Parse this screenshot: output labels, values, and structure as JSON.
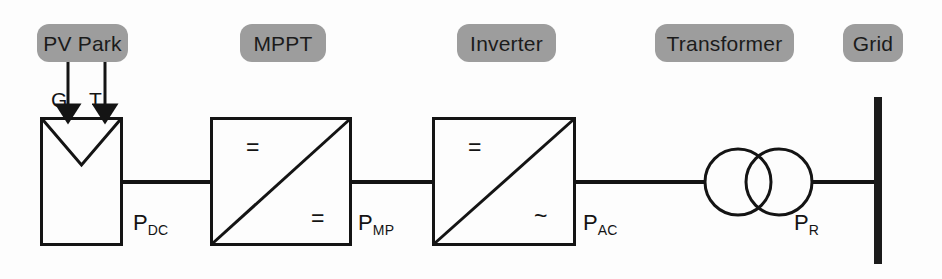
{
  "diagram": {
    "background_color": "#fdfdfd",
    "stroke_color": "#141414",
    "pill_fill": "#9d9d9d",
    "pill_text_color": "#1b1b1b"
  },
  "stage_labels": [
    {
      "id": "pv-park",
      "label": "PV Park"
    },
    {
      "id": "mppt",
      "label": "MPPT"
    },
    {
      "id": "inverter",
      "label": "Inverter"
    },
    {
      "id": "transformer",
      "label": "Transformer"
    },
    {
      "id": "grid",
      "label": "Grid"
    }
  ],
  "inputs": [
    {
      "id": "irradiance",
      "label": "G"
    },
    {
      "id": "temperature",
      "label": "T"
    }
  ],
  "converters": {
    "mppt": {
      "input_symbol": "=",
      "output_symbol": "=",
      "type": "dc-dc"
    },
    "inverter": {
      "input_symbol": "=",
      "output_symbol": "~",
      "type": "dc-ac"
    }
  },
  "power_labels": [
    {
      "id": "p-dc",
      "base": "P",
      "sub": "DC"
    },
    {
      "id": "p-mp",
      "base": "P",
      "sub": "MP"
    },
    {
      "id": "p-ac",
      "base": "P",
      "sub": "AC"
    },
    {
      "id": "p-r",
      "base": "P",
      "sub": "R"
    }
  ]
}
